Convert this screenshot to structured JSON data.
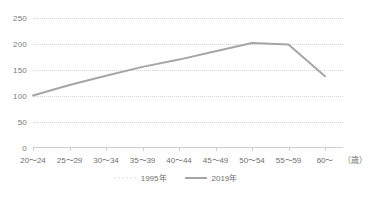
{
  "chart_data": {
    "type": "line",
    "title": "",
    "xlabel": "（歳）",
    "ylabel": "",
    "categories": [
      "20〜24",
      "25〜29",
      "30〜34",
      "35〜39",
      "40〜44",
      "45〜49",
      "50〜54",
      "55〜59",
      "60〜"
    ],
    "yticks": [
      0,
      50,
      100,
      150,
      200,
      250
    ],
    "ylim": [
      0,
      250
    ],
    "grid": true,
    "legend_position": "bottom",
    "series": [
      {
        "name": "1995年",
        "color": "#ececec",
        "style": "dotted",
        "values": [
          null,
          null,
          null,
          null,
          null,
          null,
          null,
          null,
          null
        ]
      },
      {
        "name": "2019年",
        "color": "#a6a6a6",
        "style": "solid",
        "values": [
          101,
          121,
          139,
          156,
          170,
          186,
          202,
          199,
          138
        ]
      }
    ]
  },
  "axis": {
    "unit_label": "（歳）"
  },
  "legend": {
    "items": [
      {
        "label": "1995年",
        "marker": "dotted-line-marker"
      },
      {
        "label": "2019年",
        "marker": "solid-line-marker"
      }
    ]
  },
  "colors": {
    "series_2019": "#a6a6a6",
    "series_1995": "#ececec",
    "grid": "#d6d6d6",
    "axis": "#cfcfcf",
    "text": "#6f6f6f",
    "background": "#ffffff"
  }
}
